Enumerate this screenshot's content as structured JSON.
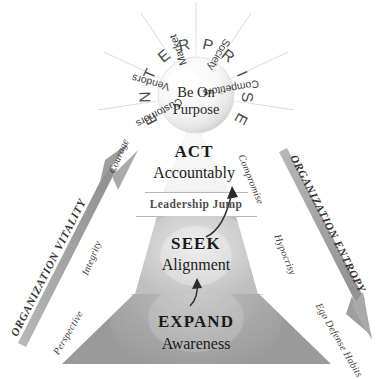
{
  "diagram": {
    "center": {
      "line1": "Be On",
      "line2": "Purpose"
    },
    "ring_word": "ENTERPRISE",
    "stakeholders": [
      "Customers",
      "Vendors",
      "Market",
      "Society",
      "Competitors"
    ],
    "levels": [
      {
        "id": "act",
        "title": "ACT",
        "subtitle": "Accountably",
        "left_virtue": "Courage",
        "right_vice": "Compromise",
        "fill": "#f2f2f2"
      },
      {
        "id": "seek",
        "title": "SEEK",
        "subtitle": "Alignment",
        "left_virtue": "Integrity",
        "right_vice": "Hypocrisy",
        "fill": "#bfbfbf"
      },
      {
        "id": "expand",
        "title": "EXPAND",
        "subtitle": "Awareness",
        "left_virtue": "Perspective",
        "right_vice": "Ego Defense Habits",
        "fill": "#9a9a9a"
      }
    ],
    "divider_band": {
      "label": "Leadership Jump"
    },
    "left_axis": {
      "label": "ORGANIZATION VITALITY",
      "direction": "up",
      "icon": "up-arrow-icon"
    },
    "right_axis": {
      "label": "ORGANIZATION ENTROPY",
      "direction": "down",
      "icon": "down-arrow-icon"
    },
    "colors": {
      "act_fill": "#f2f2f2",
      "seek_fill": "#bfbfbf",
      "expand_fill": "#9a9a9a",
      "ink": "#1a1a1a",
      "muted": "#4d4d4d",
      "background": "#ffffff"
    }
  }
}
